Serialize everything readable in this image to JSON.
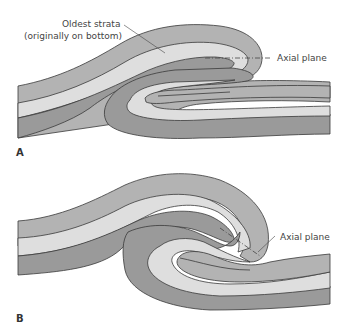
{
  "figure": {
    "type": "geologic fold diagram",
    "colors": {
      "dark_layer": "#9a9a9a",
      "medium_layer": "#b3b3b3",
      "light_layer": "#dedede",
      "outline": "#3a3a3a",
      "background": "#ffffff"
    },
    "panels": [
      {
        "id": "A",
        "label": "A",
        "annotations": [
          {
            "text_line1": "Oldest strata",
            "text_line2": "(originally on bottom)"
          },
          {
            "text": "Axial plane"
          }
        ]
      },
      {
        "id": "B",
        "label": "B",
        "annotations": [
          {
            "text": "Axial plane"
          }
        ]
      }
    ]
  }
}
